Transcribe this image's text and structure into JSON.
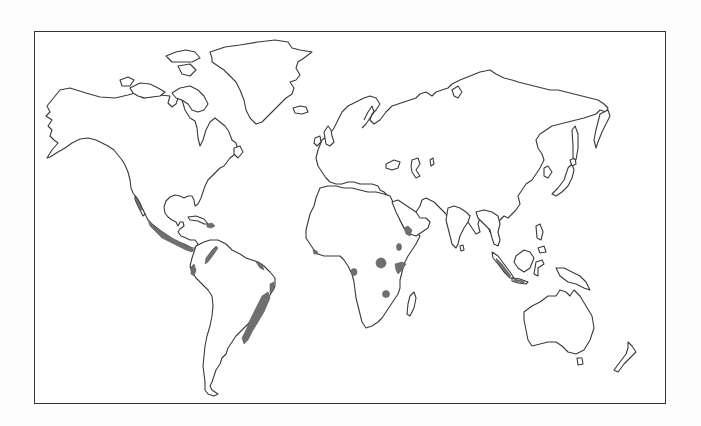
{
  "map": {
    "type": "world-outline-map",
    "projection": "miller-like cylindrical",
    "frame": {
      "x": 34,
      "y": 31,
      "width": 632,
      "height": 373,
      "border_color": "#333333"
    },
    "colors": {
      "background": "#ffffff",
      "coastline": "#3a3a3a",
      "highlight_region": "#6f6f6f"
    },
    "continents": [
      "North America",
      "Greenland",
      "South America",
      "Europe",
      "Africa",
      "Asia",
      "Australia",
      "New Zealand"
    ],
    "highlighted_regions": [
      {
        "name": "Western Mexico / Baja coast",
        "area": "North America"
      },
      {
        "name": "Central America Pacific coast",
        "area": "Central America"
      },
      {
        "name": "Caribbean island (Hispaniola area)",
        "area": "Caribbean"
      },
      {
        "name": "Northern Andes (Colombia)",
        "area": "South America"
      },
      {
        "name": "Pacific coast Ecuador/Peru",
        "area": "South America"
      },
      {
        "name": "Northeast Brazil coast",
        "area": "South America"
      },
      {
        "name": "Southeast Brazil Atlantic forest",
        "area": "South America"
      },
      {
        "name": "Ethiopian highlands / Horn",
        "area": "Africa"
      },
      {
        "name": "West African coast",
        "area": "Africa"
      },
      {
        "name": "Central Africa (Great Lakes)",
        "area": "Africa"
      },
      {
        "name": "East Africa (Kenya)",
        "area": "Africa"
      },
      {
        "name": "Central-west Africa spot",
        "area": "Africa"
      },
      {
        "name": "Southern Africa spot",
        "area": "Africa"
      },
      {
        "name": "Yemen / southwest Arabia",
        "area": "Asia"
      },
      {
        "name": "Sumatra / Java",
        "area": "Southeast Asia"
      }
    ],
    "labels": []
  }
}
